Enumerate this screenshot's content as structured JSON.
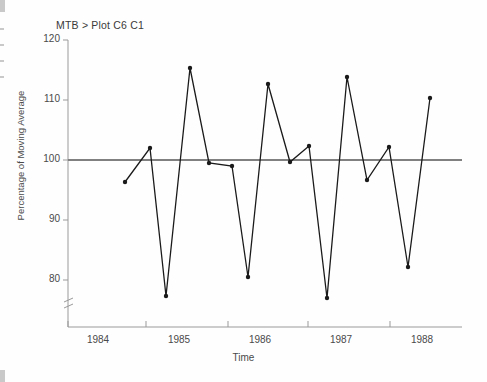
{
  "terminal": {
    "command_line": "MTB > Plot C6 C1"
  },
  "chart_data": {
    "type": "line",
    "title": "",
    "xlabel": "Time",
    "ylabel": "Percentage of Moving Average",
    "xlim": [
      1983.75,
      1988.25
    ],
    "ylim": [
      76.5,
      120
    ],
    "grid": false,
    "legend": null,
    "axis_break_y": true,
    "reference_line": {
      "y": 100,
      "color": "#808080"
    },
    "yticks": [
      80,
      90,
      100,
      110,
      120
    ],
    "ytick_labels": [
      "80",
      "90",
      "100",
      "110",
      "120"
    ],
    "xticks": [
      1984,
      1985,
      1986,
      1987,
      1988
    ],
    "xtick_labels": [
      "1984",
      "1985",
      "1986",
      "1987",
      "1988"
    ],
    "marker": "filled-circle",
    "line_color": "#1a1a1a",
    "x": [
      1984.25,
      1984.45,
      1984.58,
      1984.76,
      1984.92,
      1985.1,
      1985.24,
      1985.4,
      1985.58,
      1985.74,
      1985.88,
      1986.05,
      1986.22,
      1986.39,
      1986.55,
      1986.72
    ],
    "values": [
      97.8,
      103.4,
      79.8,
      115.5,
      100.4,
      100.0,
      82.3,
      113.0,
      100.6,
      103.3,
      79.7,
      114.0,
      98.0,
      103.2,
      84.2,
      110.6
    ],
    "points_px": [
      {
        "x": 125,
        "y": 182
      },
      {
        "x": 150,
        "y": 148
      },
      {
        "x": 166,
        "y": 296
      },
      {
        "x": 190,
        "y": 68
      },
      {
        "x": 209,
        "y": 163
      },
      {
        "x": 232,
        "y": 166
      },
      {
        "x": 248,
        "y": 277
      },
      {
        "x": 268,
        "y": 84
      },
      {
        "x": 290,
        "y": 162
      },
      {
        "x": 309,
        "y": 146
      },
      {
        "x": 327,
        "y": 298
      },
      {
        "x": 347,
        "y": 77
      },
      {
        "x": 367,
        "y": 180
      },
      {
        "x": 389,
        "y": 147
      },
      {
        "x": 408,
        "y": 267
      },
      {
        "x": 430,
        "y": 98
      }
    ]
  },
  "geometry": {
    "plot_left": 68,
    "plot_right": 462,
    "plot_top": 40,
    "plot_bottom": 327,
    "ytick_px": {
      "120": 40,
      "110": 100,
      "100": 160,
      "90": 220,
      "80": 280
    },
    "xtick_px": {
      "1984": 68,
      "1985": 146,
      "1986": 228,
      "1987": 308,
      "1988": 390
    }
  }
}
